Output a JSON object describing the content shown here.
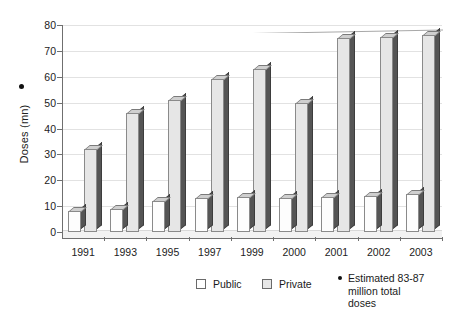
{
  "chart_data": {
    "type": "bar",
    "title": "",
    "xlabel": "",
    "ylabel": "Doses (mn)",
    "ylim": [
      0,
      80
    ],
    "yticks": [
      0,
      10,
      20,
      30,
      40,
      50,
      60,
      70,
      80
    ],
    "ytick_labels": [
      "0",
      "10",
      "20",
      "30",
      "40",
      "50",
      "60",
      "70",
      "80"
    ],
    "grid": true,
    "legend_position": "bottom",
    "categories": [
      "1991",
      "1993",
      "1995",
      "1997",
      "1999",
      "2000",
      "2001",
      "2002",
      "2003"
    ],
    "series": [
      {
        "name": "Public",
        "values": [
          8,
          9,
          12,
          13,
          13.5,
          13,
          13.5,
          14,
          14.5
        ]
      },
      {
        "name": "Private",
        "values": [
          32,
          46,
          51,
          59,
          63,
          50,
          75,
          75.5,
          76
        ]
      }
    ],
    "annotations": [
      {
        "marker": "•",
        "text": "Estimated 83-87 million total doses",
        "attached_to": "Doses (mn)"
      }
    ]
  },
  "legend": {
    "items": [
      {
        "label": "Public",
        "swatch": "public-swatch"
      },
      {
        "label": "Private",
        "swatch": "private-swatch"
      }
    ],
    "note": {
      "bullet": "•",
      "line1": "Estimated 83-87",
      "line2": "million total",
      "line3": "doses"
    }
  },
  "colors": {
    "public_fill": "#fdfdfd",
    "private_fill": "#e6e6e6",
    "bar_side": "#555555",
    "bar_top": "#cfcfcf",
    "axis": "#6f6f6f",
    "gridline": "#e2e2e2",
    "text": "#1a1a1a"
  }
}
